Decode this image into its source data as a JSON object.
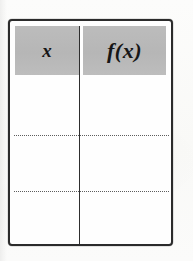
{
  "document": {
    "type": "function-table",
    "background_color": "#fbfbfa"
  },
  "table": {
    "border_color": "#2b2b2b",
    "header_fill": "#b9b9b9",
    "divider_color": "#2e2e2e",
    "separator_color": "#5d5d5d",
    "columns": [
      {
        "key": "x",
        "label": "x"
      },
      {
        "key": "fx",
        "label": "f(x)"
      }
    ],
    "rows": [
      {
        "x": "",
        "fx": ""
      },
      {
        "x": "",
        "fx": ""
      },
      {
        "x": "",
        "fx": ""
      }
    ]
  }
}
